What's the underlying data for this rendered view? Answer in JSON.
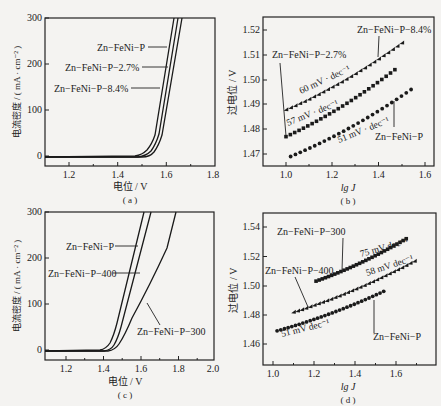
{
  "chart_data": [
    {
      "panel": "(a)",
      "type": "line",
      "xlabel": "电位 / V",
      "ylabel": "电流密度 / ( mA · cm⁻² )",
      "xlim": [
        1.1,
        1.8
      ],
      "ylim": [
        -20,
        300
      ],
      "xticks": [
        "1.2",
        "1.4",
        "1.6",
        "1.8"
      ],
      "yticks": [
        "0",
        "100",
        "200",
        "300"
      ],
      "series": [
        {
          "name": "Zn-FeNi-P",
          "onset_V": 1.42,
          "x": [
            1.1,
            1.4,
            1.44,
            1.48,
            1.52,
            1.56,
            1.6,
            1.64
          ],
          "y": [
            0,
            2,
            12,
            50,
            110,
            180,
            250,
            300
          ]
        },
        {
          "name": "Zn-FeNi-P-2.7%",
          "onset_V": 1.44,
          "x": [
            1.1,
            1.42,
            1.46,
            1.5,
            1.54,
            1.58,
            1.62,
            1.655
          ],
          "y": [
            0,
            2,
            12,
            50,
            110,
            180,
            250,
            300
          ]
        },
        {
          "name": "Zn-FeNi-P-8.4%",
          "onset_V": 1.46,
          "x": [
            1.1,
            1.44,
            1.48,
            1.52,
            1.56,
            1.6,
            1.64,
            1.68
          ],
          "y": [
            0,
            2,
            12,
            50,
            110,
            180,
            250,
            300
          ]
        }
      ]
    },
    {
      "panel": "(b)",
      "type": "scatter",
      "xlabel": "lg J",
      "ylabel": "过电位 / V",
      "xlim": [
        0.9,
        1.65
      ],
      "ylim": [
        1.465,
        1.525
      ],
      "xticks": [
        "1.0",
        "1.2",
        "1.4",
        "1.6"
      ],
      "yticks": [
        "1.47",
        "1.48",
        "1.49",
        "1.50",
        "1.51",
        "1.52"
      ],
      "series": [
        {
          "name": "Zn-FeNi-P-8.4%",
          "marker": "triangle",
          "tafel": "60 mV · dec⁻¹",
          "x": [
            1.0,
            1.5
          ],
          "y": [
            1.488,
            1.515
          ]
        },
        {
          "name": "Zn-FeNi-P-2.7%",
          "marker": "square",
          "tafel": "57 mV · dec⁻¹",
          "x": [
            1.0,
            1.47
          ],
          "y": [
            1.477,
            1.504
          ]
        },
        {
          "name": "Zn-FeNi-P",
          "marker": "circle",
          "tafel": "51 mV · dec⁻¹",
          "x": [
            1.02,
            1.54
          ],
          "y": [
            1.469,
            1.496
          ]
        }
      ]
    },
    {
      "panel": "(c)",
      "type": "line",
      "xlabel": "电位 / V",
      "ylabel": "电流密度 / ( mA · cm⁻² )",
      "xlim": [
        1.1,
        2.0
      ],
      "ylim": [
        -20,
        300
      ],
      "xticks": [
        "1.2",
        "1.4",
        "1.6",
        "1.8",
        "2.0"
      ],
      "yticks": [
        "0",
        "100",
        "200",
        "300"
      ],
      "series": [
        {
          "name": "Zn-FeNi-P",
          "x": [
            1.1,
            1.4,
            1.44,
            1.48,
            1.52,
            1.56,
            1.6,
            1.62
          ],
          "y": [
            0,
            2,
            15,
            60,
            130,
            210,
            280,
            300
          ]
        },
        {
          "name": "Zn-FeNi-P-400",
          "x": [
            1.1,
            1.42,
            1.46,
            1.5,
            1.54,
            1.58,
            1.62,
            1.66
          ],
          "y": [
            0,
            2,
            12,
            50,
            120,
            190,
            260,
            300
          ]
        },
        {
          "name": "Zn-FeNi-P-300",
          "x": [
            1.1,
            1.44,
            1.48,
            1.52,
            1.58,
            1.64,
            1.7,
            1.76,
            1.81
          ],
          "y": [
            0,
            2,
            10,
            35,
            80,
            130,
            185,
            245,
            300
          ]
        }
      ]
    },
    {
      "panel": "(d)",
      "type": "scatter",
      "xlabel": "lg J",
      "ylabel": "过电位 / V",
      "xlim": [
        0.95,
        1.75
      ],
      "ylim": [
        1.45,
        1.55
      ],
      "xticks": [
        "1.0",
        "1.2",
        "1.4",
        "1.6"
      ],
      "yticks": [
        "1.46",
        "1.48",
        "1.50",
        "1.52",
        "1.54"
      ],
      "series": [
        {
          "name": "Zn-FeNi-P-300",
          "marker": "square",
          "tafel": "75 mV dec⁻¹",
          "x": [
            1.21,
            1.65
          ],
          "y": [
            1.503,
            1.532
          ]
        },
        {
          "name": "Zn-FeNi-P-400",
          "marker": "triangle",
          "tafel": "58 mV dec⁻¹",
          "x": [
            1.1,
            1.69
          ],
          "y": [
            1.482,
            1.517
          ]
        },
        {
          "name": "Zn-FeNi-P",
          "marker": "circle",
          "tafel": "51 mV dec⁻¹",
          "x": [
            1.02,
            1.54
          ],
          "y": [
            1.469,
            1.496
          ]
        }
      ]
    }
  ],
  "panels": {
    "a": {
      "caption": "( a )",
      "xlabel": "电位 / V",
      "ylabel": "电流密度 / ( mA · cm⁻² )",
      "xticks": [
        "1.2",
        "1.4",
        "1.6",
        "1.8"
      ],
      "yticks": [
        "0",
        "100",
        "200",
        "300"
      ],
      "labels": [
        "Zn−FeNi−P",
        "Zn−FeNi−P−2.7%",
        "Zn−FeNi−P−8.4%"
      ]
    },
    "b": {
      "caption": "( b )",
      "xlabel": "lg J",
      "ylabel": "过电位 / V",
      "xticks": [
        "1.0",
        "1.2",
        "1.4",
        "1.6"
      ],
      "yticks": [
        "1.52",
        "1.51",
        "1.50",
        "1.49",
        "1.48",
        "1.47"
      ],
      "labels": [
        "Zn−FeNi−P−8.4%",
        "Zn−FeNi−P−2.7%",
        "Zn−FeNi−P"
      ],
      "slopes": [
        "60 mV · dec⁻¹",
        "57 mV · dec⁻¹",
        "51 mV · dec⁻¹"
      ]
    },
    "c": {
      "caption": "( c )",
      "xlabel": "电位 / V",
      "ylabel": "电流密度 / ( mA · cm⁻² )",
      "xticks": [
        "1.2",
        "1.4",
        "1.6",
        "1.8",
        "2.0"
      ],
      "yticks": [
        "0",
        "100",
        "200",
        "300"
      ],
      "labels": [
        "Zn−FeNi−P",
        "Zn−FeNi−P−400",
        "Zn−FeNi−P−300"
      ]
    },
    "d": {
      "caption": "( d )",
      "xlabel": "lg J",
      "ylabel": "过电位 / V",
      "xticks": [
        "1.0",
        "1.2",
        "1.4",
        "1.6"
      ],
      "yticks": [
        "1.54",
        "1.52",
        "1.50",
        "1.48",
        "1.46"
      ],
      "labels": [
        "Zn−FeNi−P−300",
        "Zn−FeNi−P−400",
        "Zn−FeNi−P"
      ],
      "slopes": [
        "75 mV dec⁻¹",
        "58 mV dec⁻¹",
        "51 mV dec⁻¹"
      ]
    }
  }
}
